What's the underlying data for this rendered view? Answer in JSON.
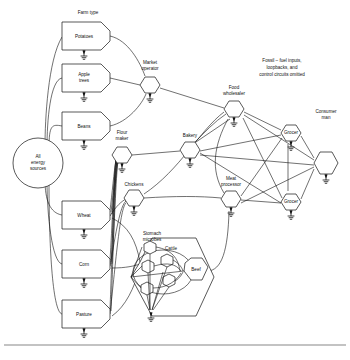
{
  "figure": {
    "title_note": "Fossil – fuel inputs, loopbacks, and control circuits omitted",
    "column_label": "Farm type",
    "background_color": "#ffffff",
    "line_color": "#111111"
  },
  "nodes": {
    "source": {
      "label": "All energy sources",
      "shape": "circle",
      "x": 38,
      "y": 163
    },
    "farm": [
      {
        "label": "Potatoes",
        "shape": "producer-box",
        "x": 82,
        "y": 34
      },
      {
        "label": "Apple trees",
        "shape": "producer-box",
        "x": 82,
        "y": 76
      },
      {
        "label": "Beans",
        "shape": "producer-box",
        "x": 82,
        "y": 124
      },
      {
        "label": "Wheat",
        "shape": "producer-box",
        "x": 82,
        "y": 213
      },
      {
        "label": "Corn",
        "shape": "producer-box",
        "x": 82,
        "y": 262
      },
      {
        "label": "Pasture",
        "shape": "producer-box",
        "x": 82,
        "y": 312
      }
    ],
    "processors": [
      {
        "label": "Market operator",
        "shape": "hexagon",
        "x": 150,
        "y": 85
      },
      {
        "label": "Flour maker",
        "shape": "hexagon",
        "x": 122,
        "y": 155
      },
      {
        "label": "Chickens",
        "shape": "hexagon",
        "x": 134,
        "y": 198
      },
      {
        "label": "Bakery",
        "shape": "hexagon",
        "x": 190,
        "y": 150
      },
      {
        "label": "Food wholesaler",
        "shape": "hexagon",
        "x": 234,
        "y": 109
      },
      {
        "label": "Meat processor",
        "shape": "hexagon",
        "x": 231,
        "y": 199
      },
      {
        "label": "Grocer",
        "shape": "hexagon",
        "x": 291,
        "y": 133
      },
      {
        "label": "Grocer",
        "shape": "hexagon",
        "x": 291,
        "y": 202
      },
      {
        "label": "Consumer man",
        "shape": "hexagon",
        "x": 324,
        "y": 163
      }
    ],
    "livestock": {
      "outer_label": "Cattle",
      "outer_shape": "hexagon",
      "outer_x": 168,
      "outer_y": 277,
      "inner_label": "Stomach microbes",
      "inner_count": 5,
      "product_label": "Beef",
      "product_shape": "hexagon",
      "product_x": 196,
      "product_y": 271
    }
  },
  "legend": {
    "ground_symbol": "ground",
    "energy_flow": "left-to-right"
  }
}
